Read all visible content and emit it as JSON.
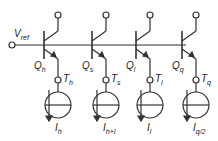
{
  "vref": {
    "main": "V",
    "sub": "ref"
  },
  "stages": [
    {
      "q": "Q",
      "qs": "h",
      "t": "T",
      "ts": "h",
      "i": "I",
      "is": "h",
      "x": 58
    },
    {
      "q": "Q",
      "qs": "s",
      "t": "T",
      "ts": "s",
      "i": "I",
      "is": "h+I",
      "x": 106
    },
    {
      "q": "Q",
      "qs": "l",
      "t": "T",
      "ts": "l",
      "i": "I",
      "is": "l",
      "x": 150
    },
    {
      "q": "Q",
      "qs": "q",
      "t": "T",
      "ts": "q",
      "i": "I",
      "is": "q/2",
      "x": 196
    }
  ],
  "colors": {
    "line": "#333333"
  }
}
